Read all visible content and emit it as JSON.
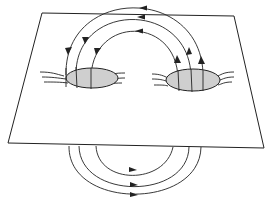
{
  "diagram": {
    "title": "",
    "colors": {
      "line": "#222222",
      "spot_fill": "#cfcfcf",
      "background": "#ffffff"
    },
    "elements": {
      "plane": {
        "label": "",
        "corners": [
          [
            42,
            13
          ],
          [
            234,
            16
          ],
          [
            264,
            148
          ],
          [
            8,
            143
          ]
        ]
      },
      "spots": [
        {
          "name": "left-spot",
          "center": [
            92,
            78
          ],
          "rx": 26,
          "ry": 10
        },
        {
          "name": "right-spot",
          "center": [
            193,
            80
          ],
          "rx": 27,
          "ry": 11
        }
      ],
      "upper_loops": {
        "count": 3,
        "direction": "right-to-left (arrows pointing from right spot toward left spot)"
      },
      "lower_loops": {
        "count": 3,
        "direction": "left-to-right (arrows pointing right)"
      }
    },
    "text_labels": []
  }
}
